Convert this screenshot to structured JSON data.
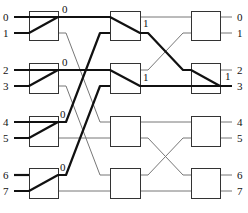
{
  "inputs": [
    {
      "label": "0",
      "y": 17
    },
    {
      "label": "1",
      "y": 33
    },
    {
      "label": "2",
      "y": 70
    },
    {
      "label": "3",
      "y": 86
    },
    {
      "label": "4",
      "y": 122
    },
    {
      "label": "5",
      "y": 138
    },
    {
      "label": "6",
      "y": 175
    },
    {
      "label": "7",
      "y": 191
    }
  ],
  "outputs": [
    {
      "label": "0",
      "y": 17
    },
    {
      "label": "1",
      "y": 33
    },
    {
      "label": "2",
      "y": 70
    },
    {
      "label": "3",
      "y": 86
    },
    {
      "label": "4",
      "y": 122
    },
    {
      "label": "5",
      "y": 138
    },
    {
      "label": "6",
      "y": 175
    },
    {
      "label": "7",
      "y": 191
    }
  ],
  "stages": [
    {
      "x": 29,
      "w": 29
    },
    {
      "x": 110,
      "w": 30
    },
    {
      "x": 191,
      "w": 29
    }
  ],
  "rows": [
    {
      "y": 11,
      "h": 29
    },
    {
      "y": 63,
      "h": 30
    },
    {
      "y": 116,
      "h": 30
    },
    {
      "y": 168,
      "h": 30
    }
  ],
  "switch_labels": [
    {
      "text": "0",
      "x": 62,
      "y": 13
    },
    {
      "text": "0",
      "x": 62,
      "y": 66
    },
    {
      "text": "0",
      "x": 60,
      "y": 118
    },
    {
      "text": "0",
      "x": 60,
      "y": 171
    },
    {
      "text": "1",
      "x": 143,
      "y": 27
    },
    {
      "text": "1",
      "x": 143,
      "y": 81
    },
    {
      "text": "1",
      "x": 225,
      "y": 80
    }
  ],
  "thin_links": [
    [
      58,
      33,
      66,
      33,
      100,
      122,
      110,
      122
    ],
    [
      58,
      86,
      66,
      86,
      100,
      175,
      110,
      175
    ],
    [
      58,
      138,
      110,
      138
    ],
    [
      58,
      191,
      110,
      191
    ],
    [
      140,
      17,
      191,
      17
    ],
    [
      140,
      70,
      148,
      70,
      183,
      33,
      191,
      33
    ],
    [
      140,
      122,
      191,
      122
    ],
    [
      140,
      138,
      148,
      138,
      183,
      175,
      191,
      175
    ],
    [
      140,
      191,
      191,
      191
    ],
    [
      140,
      175,
      148,
      175,
      183,
      138,
      191,
      138
    ],
    [
      220,
      17,
      232,
      17
    ],
    [
      220,
      33,
      232,
      33
    ],
    [
      220,
      70,
      232,
      70
    ],
    [
      220,
      122,
      232,
      122
    ],
    [
      220,
      138,
      232,
      138
    ],
    [
      220,
      175,
      232,
      175
    ],
    [
      220,
      191,
      232,
      191
    ]
  ],
  "thick_paths": [
    [
      14,
      17,
      110,
      17,
      140,
      33,
      148,
      33,
      183,
      70,
      191,
      70,
      220,
      86,
      232,
      86
    ],
    [
      14,
      33,
      29,
      33,
      58,
      17
    ],
    [
      14,
      70,
      110,
      70,
      140,
      86,
      232,
      86
    ],
    [
      14,
      86,
      29,
      86,
      58,
      70
    ],
    [
      14,
      122,
      58,
      122,
      66,
      122,
      100,
      33,
      110,
      33
    ],
    [
      14,
      138,
      29,
      138,
      58,
      122
    ],
    [
      14,
      175,
      29,
      175
    ],
    [
      14,
      191,
      29,
      191,
      58,
      175,
      66,
      175,
      100,
      86,
      110,
      86
    ]
  ],
  "colors": {
    "thick": "#111111",
    "thin": "#777777",
    "box": "#333333",
    "text": "#111111"
  }
}
